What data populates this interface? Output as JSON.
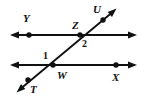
{
  "figure": {
    "background_color": "#ffffff",
    "stroke_color": "#111111",
    "canvas": {
      "width": 141,
      "height": 103
    },
    "point_labels": [
      {
        "key": "Y",
        "text": "Y",
        "x": 23,
        "y": 13
      },
      {
        "key": "Z",
        "text": "Z",
        "x": 72,
        "y": 20
      },
      {
        "key": "U",
        "text": "U",
        "x": 93,
        "y": 4
      },
      {
        "key": "W",
        "text": "W",
        "x": 57,
        "y": 70
      },
      {
        "key": "X",
        "text": "X",
        "x": 112,
        "y": 72
      },
      {
        "key": "T",
        "text": "T",
        "x": 30,
        "y": 84
      }
    ],
    "angle_labels": [
      {
        "key": "1",
        "text": "1",
        "x": 43,
        "y": 51
      },
      {
        "key": "2",
        "text": "2",
        "x": 82,
        "y": 39
      }
    ],
    "lines": [
      {
        "name": "upper-parallel-line",
        "x1": 13,
        "y1": 35,
        "x2": 134,
        "y2": 35,
        "arrow_start": true,
        "arrow_end": true
      },
      {
        "name": "lower-parallel-line",
        "x1": 13,
        "y1": 65,
        "x2": 134,
        "y2": 65,
        "arrow_start": true,
        "arrow_end": true
      },
      {
        "name": "transversal-line",
        "x1": 19,
        "y1": 90,
        "x2": 114,
        "y2": 11,
        "arrow_start": true,
        "arrow_end": true
      }
    ],
    "points": [
      {
        "name": "point-Y",
        "x": 29,
        "y": 35
      },
      {
        "name": "point-Z",
        "x": 80,
        "y": 35
      },
      {
        "name": "point-U",
        "x": 103,
        "y": 20
      },
      {
        "name": "point-W",
        "x": 53,
        "y": 65
      },
      {
        "name": "point-X",
        "x": 116,
        "y": 65
      },
      {
        "name": "point-T",
        "x": 28,
        "y": 80
      }
    ]
  }
}
